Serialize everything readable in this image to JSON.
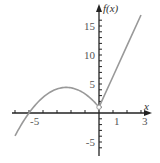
{
  "chart_data": {
    "type": "line",
    "title": "",
    "xlabel": "x",
    "ylabel": "f(x)",
    "xlim": [
      -6.5,
      3.8
    ],
    "ylim": [
      -7,
      18
    ],
    "grid": false,
    "x_tick_labels": [
      {
        "value": -5,
        "label": "-5"
      },
      {
        "value": 1,
        "label": "1"
      },
      {
        "value": 3,
        "label": "3"
      }
    ],
    "x_ticks": [
      -6,
      -5,
      -4,
      -3,
      -2,
      -1,
      1,
      2,
      3
    ],
    "y_tick_labels": [
      {
        "value": 15,
        "label": "15"
      },
      {
        "value": 10,
        "label": "10"
      },
      {
        "value": 5,
        "label": "5"
      },
      {
        "value": -5,
        "label": "-5"
      }
    ],
    "y_ticks": [
      -6,
      -5,
      -4,
      -3,
      -2,
      -1,
      1,
      2,
      3,
      4,
      5,
      6,
      7,
      8,
      9,
      10,
      11,
      12,
      13,
      14,
      15,
      16
    ],
    "series": [
      {
        "name": "f(x), x<0 (parabola)",
        "x": [
          -6,
          -5,
          -4,
          -3,
          -2.5,
          -2,
          -1,
          0
        ],
        "y": [
          -3.8,
          0,
          2.9,
          4.6,
          4.9,
          4.8,
          3.6,
          1
        ]
      },
      {
        "name": "f(x), x>=0 (line)",
        "x": [
          0,
          1,
          2,
          3
        ],
        "y": [
          1,
          6.3,
          11.6,
          16.9
        ]
      }
    ],
    "curve_color": "#999999",
    "axis_color": "#222222"
  }
}
